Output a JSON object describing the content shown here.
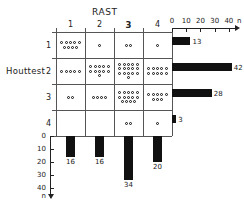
{
  "chart_data": {
    "type": "heatmap",
    "title": "RAST",
    "xlabel": "RAST",
    "ylabel": "Houttest",
    "col_categories": [
      "1",
      "2",
      "3",
      "4"
    ],
    "row_categories": [
      "1",
      "2",
      "3",
      "4"
    ],
    "highlight_column": "3",
    "counts": [
      [
        9,
        1,
        2,
        1
      ],
      [
        5,
        11,
        16,
        10
      ],
      [
        2,
        4,
        14,
        8
      ],
      [
        0,
        0,
        2,
        1
      ]
    ],
    "row_totals": [
      13,
      42,
      28,
      3
    ],
    "col_totals": [
      16,
      16,
      34,
      20
    ],
    "top_axis": {
      "ticks": [
        0,
        10,
        20,
        30,
        40
      ],
      "tick_labels": [
        "0",
        "10",
        "20",
        "30",
        "40"
      ],
      "unit_label": "n",
      "max": 45
    },
    "bottom_axis": {
      "ticks": [
        0,
        10,
        20,
        30,
        40
      ],
      "tick_labels": [
        "0",
        "10",
        "20",
        "30",
        "40"
      ],
      "unit_label": "n",
      "max": 45
    },
    "dot_symbol": "open-circle",
    "bar_color": "#111111",
    "grid": true,
    "legend": "none"
  },
  "labels": {
    "rast": "RAST",
    "houttest": "Houttest"
  }
}
